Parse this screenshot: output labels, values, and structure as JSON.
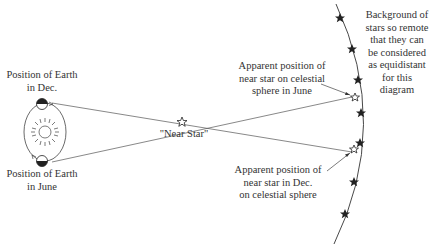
{
  "diagram": {
    "type": "stellar-parallax",
    "labels": {
      "earth_dec": [
        "Position of Earth",
        "in Dec."
      ],
      "earth_june": [
        "Position of Earth",
        "in June"
      ],
      "near_star": "\"Near Star\"",
      "apparent_june": [
        "Apparent position of",
        "near star on celestial",
        "sphere in June"
      ],
      "apparent_dec": [
        "Apparent position of",
        "near star in Dec.",
        "on celestial sphere"
      ],
      "background": [
        "Background of",
        "stars so remote",
        "that they can",
        "be considered",
        "as equidistant",
        "for this",
        "diagram"
      ]
    },
    "elements": {
      "sun": "sun-icon",
      "earth": "earth-icon",
      "near_star": "open-star-icon",
      "background_star": "filled-star-icon",
      "celestial_sphere": "arc"
    },
    "colors": {
      "ink": "#333333",
      "background": "#ffffff"
    }
  }
}
